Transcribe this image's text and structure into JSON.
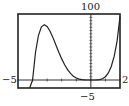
{
  "chart_data": {
    "type": "line",
    "title": "",
    "function": "f(x) = x^5 + 4x^4",
    "xlabel": "",
    "ylabel": "",
    "xlim": [
      -5,
      2
    ],
    "ylim": [
      -5,
      100
    ],
    "x_tick_step": 1,
    "y_tick_step": 5,
    "grid": false,
    "legend": null,
    "tick_labels": {
      "xmin": "−5",
      "xmax": "2",
      "ymax": "100",
      "ymin": "−5"
    },
    "series": [
      {
        "name": "f(x)",
        "x": [
          -4.2,
          -4.0,
          -3.8,
          -3.6,
          -3.4,
          -3.2,
          -3.0,
          -2.8,
          -2.6,
          -2.4,
          -2.2,
          -2.0,
          -1.8,
          -1.6,
          -1.4,
          -1.2,
          -1.0,
          -0.8,
          -0.6,
          -0.4,
          -0.2,
          0.0,
          0.2,
          0.4,
          0.6,
          0.8,
          1.0,
          1.2,
          1.4,
          1.6,
          1.8,
          2.0
        ],
        "values": [
          -62.2,
          0.0,
          41.7,
          67.2,
          80.2,
          83.9,
          81.0,
          73.8,
          64.2,
          53.1,
          42.2,
          32.0,
          23.0,
          15.7,
          10.0,
          5.8,
          3.0,
          1.3,
          0.44,
          0.09,
          0.006,
          0.0,
          0.0074,
          0.113,
          0.596,
          1.97,
          5.0,
          10.7,
          20.4,
          35.7,
          59.0,
          96.0
        ]
      }
    ],
    "annotations": []
  },
  "colors": {
    "curve": "#222222",
    "frame": "#222222",
    "axis": "#333333",
    "background": "#ffffff"
  }
}
